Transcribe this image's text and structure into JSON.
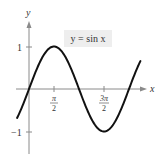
{
  "chart_data": {
    "type": "line",
    "title": "",
    "xlabel": "x",
    "ylabel": "y",
    "annotation": "y = sin x",
    "series": [
      {
        "name": "y = sin x",
        "function": "sin(x)",
        "x_range": [
          -0.75,
          7.0
        ],
        "points": [
          {
            "x": 0,
            "y": 0
          },
          {
            "x": 1.5708,
            "y": 1
          },
          {
            "x": 3.1416,
            "y": 0
          },
          {
            "x": 4.7124,
            "y": -1
          },
          {
            "x": 6.2832,
            "y": 0
          }
        ]
      }
    ],
    "x_ticks": [
      {
        "value": 1.5708,
        "num": "π",
        "den": "2"
      },
      {
        "value": 4.7124,
        "num": "3π",
        "den": "2"
      }
    ],
    "y_ticks": [
      {
        "value": 1,
        "label": "1"
      },
      {
        "value": -1,
        "label": "−1"
      }
    ],
    "xlim": [
      -0.8,
      7.4
    ],
    "ylim": [
      -1.5,
      1.6
    ],
    "grid": false,
    "colors": {
      "curve": "#111111",
      "axis": "#888888",
      "label_box": "#eeeeee"
    }
  }
}
